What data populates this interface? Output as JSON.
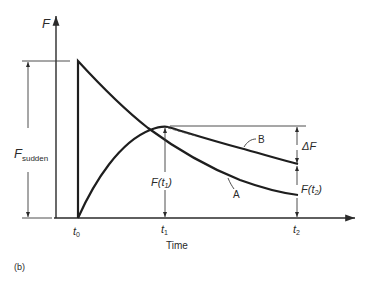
{
  "figure": {
    "panel_label": "(b)",
    "y_axis_label": "F",
    "x_axis_label": "Time",
    "ticks": {
      "t0": "t",
      "t0_sub": "0",
      "t1": "t",
      "t1_sub": "1",
      "t2": "t",
      "t2_sub": "2"
    },
    "annotations": {
      "f_sudden_main": "F",
      "f_sudden_sub": "sudden",
      "f_t1": "F(t",
      "f_t1_sub": "1",
      "f_t1_close": ")",
      "f_t2": "F(t",
      "f_t2_sub": "2",
      "f_t2_close": ")",
      "delta_f": "ΔF"
    },
    "curves": {
      "a_label": "A",
      "b_label": "B"
    },
    "colors": {
      "line": "#1e1e1e",
      "thin": "#3a3a3a",
      "background": "#ffffff"
    }
  }
}
